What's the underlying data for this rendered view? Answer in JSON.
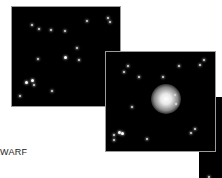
{
  "figure": {
    "caption_fragment": "WARF",
    "panels": [
      {
        "id": "panel-1",
        "content": "star-field"
      },
      {
        "id": "panel-2",
        "content": "star-field-with-central-glow"
      },
      {
        "id": "panel-3",
        "content": "star-field-partial"
      }
    ]
  }
}
